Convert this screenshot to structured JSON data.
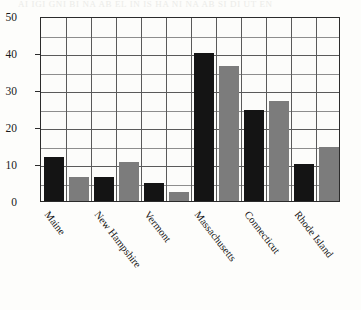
{
  "figure": {
    "bleed_text": "AI IGI GNI BI NA AB EL IN IS HA NI NA AB SI DI UT EN",
    "axis_color": "#2b2b2b",
    "grid_color": "#5a5a5a",
    "series_colors": {
      "series1": "#141414",
      "series2": "#7c7c7c"
    }
  },
  "chart_data": {
    "type": "bar",
    "title": "",
    "xlabel": "",
    "ylabel": "",
    "categories": [
      "Maine",
      "New Hampshire",
      "Vermont",
      "Massachusetts",
      "Connecticut",
      "Rhode Island"
    ],
    "series": [
      {
        "name": "series1",
        "color": "#141414",
        "values": [
          12,
          6.5,
          5,
          40,
          24.5,
          10
        ]
      },
      {
        "name": "series2",
        "color": "#7c7c7c",
        "values": [
          6.5,
          10.5,
          2.5,
          36.5,
          27,
          14.5
        ]
      }
    ],
    "ylim": [
      0,
      50
    ],
    "yticks": [
      0,
      10,
      20,
      30,
      40,
      50
    ],
    "ytick_labels": [
      "0",
      "10",
      "20",
      "30",
      "40",
      "50"
    ],
    "yminor_step": 5,
    "grid": true,
    "legend": null
  }
}
